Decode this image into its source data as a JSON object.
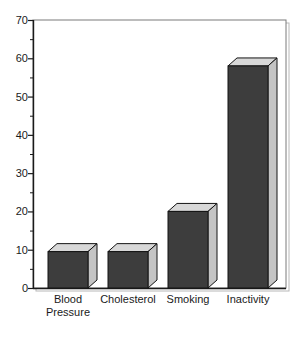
{
  "chart_data": {
    "type": "bar",
    "title": "",
    "subtitle": "",
    "xlabel": "",
    "ylabel": "",
    "categories": [
      "Blood Pressure",
      "Cholesterol",
      "Smoking",
      "Inactivity"
    ],
    "category_lines": [
      [
        "Blood",
        "Pressure"
      ],
      [
        "Cholesterol"
      ],
      [
        "Smoking"
      ],
      [
        "Inactivity"
      ]
    ],
    "values": [
      9.5,
      9.5,
      20,
      58
    ],
    "ylim": [
      0,
      70
    ],
    "ytick_values": [
      0,
      10,
      20,
      30,
      40,
      50,
      60,
      70
    ],
    "ytick_labels": [
      "0",
      "10",
      "20",
      "30",
      "40",
      "50",
      "60",
      "70"
    ],
    "yminor_values": [
      5,
      15,
      25,
      35,
      45,
      55,
      65
    ],
    "grid": false,
    "legend": null,
    "legend_position": "none",
    "annotations": [],
    "style": "3d-bars"
  },
  "colors": {
    "bar_front": "#3d3d3d",
    "bar_top": "#d8d8d8",
    "bar_side": "#c4c4c4",
    "bar_outline": "#141414",
    "axis": "#1a1a1a",
    "plot_border": "#7a7a7a",
    "plot_shadow": "#b8b8b8",
    "background": "#ffffff",
    "text": "#1a1a1a"
  },
  "geometry": {
    "plot_left": 33,
    "plot_right": 286,
    "plot_top": 20,
    "plot_bottom": 288,
    "depth_x": 9,
    "depth_y": 8,
    "bar_width": 40,
    "bar_centers": [
      68,
      128,
      188,
      248
    ],
    "label_baseline_1": 303,
    "label_baseline_2": 316,
    "tick_len": 5,
    "minor_tick_len": 3,
    "tick_label_x": 28
  }
}
